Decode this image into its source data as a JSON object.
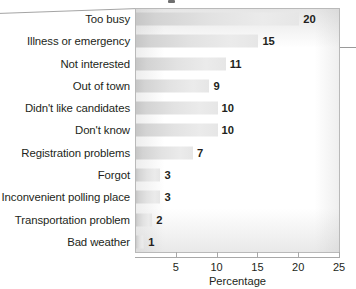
{
  "chart_data": {
    "type": "bar",
    "orientation": "horizontal",
    "title": "",
    "xlabel": "Percentage",
    "ylabel": "",
    "categories": [
      "Too busy",
      "Illness or emergency",
      "Not interested",
      "Out of town",
      "Didn't like candidates",
      "Don't know",
      "Registration problems",
      "Forgot",
      "Inconvenient polling place",
      "Transportation problem",
      "Bad weather"
    ],
    "values": [
      20,
      15,
      11,
      9,
      10,
      10,
      7,
      3,
      3,
      2,
      1
    ],
    "value_labels": [
      "20",
      "15",
      "11",
      "9",
      "10",
      "10",
      "7",
      "3",
      "3",
      "2",
      "1"
    ],
    "xlim": [
      0,
      25
    ],
    "xticks": [
      5,
      10,
      15,
      20,
      25
    ],
    "xtick_labels": [
      "5",
      "10",
      "15",
      "20",
      "25"
    ],
    "grid": false,
    "legend": null,
    "bar_color": "#dcdcdc",
    "text_color": "#231f20",
    "panel_border_color": "#b9b9b9",
    "axis_color": "#a8a8a8"
  }
}
